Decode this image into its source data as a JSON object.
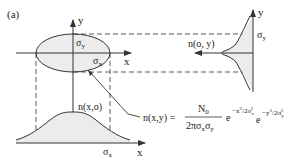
{
  "figure": {
    "panel_label": "(a)",
    "colors": {
      "line": "#333333",
      "fill": "#ececec",
      "background": "#ffffff"
    },
    "top_left": {
      "axis_x_label": "x",
      "axis_y_label": "y",
      "sigma_y_label": {
        "base": "σ",
        "sub": "y"
      },
      "sigma_x_label": {
        "base": "σ",
        "sub": "x"
      }
    },
    "right_profile": {
      "axis_y_label": "y",
      "sigma_y_label": {
        "base": "σ",
        "sub": "y"
      },
      "function_label": "n(o, y)"
    },
    "bottom_profile": {
      "axis_x_label": "x",
      "sigma_x_label": {
        "base": "σ",
        "sub": "x"
      },
      "function_label": "n(x,o)"
    },
    "equation": {
      "lhs": "n(x,y) =",
      "numerator": {
        "base": "N",
        "sub": "0"
      },
      "denominator": "2πσxσy",
      "denominator_parts": [
        "2πσ",
        "x",
        "σ",
        "y"
      ],
      "exp1": "e",
      "exp1_power": "−x²/2σx²",
      "exp2": "e",
      "exp2_power": "−y²/2σy²"
    }
  }
}
